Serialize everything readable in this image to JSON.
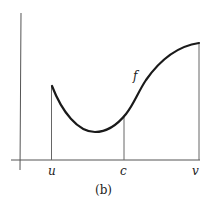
{
  "figure": {
    "caption": "(b)",
    "function_label": "f",
    "x_labels": {
      "u": "u",
      "c": "c",
      "v": "v"
    },
    "colors": {
      "axis": "#555555",
      "curve": "#1a1a1a",
      "guide": "#666666",
      "background": "#ffffff"
    }
  }
}
